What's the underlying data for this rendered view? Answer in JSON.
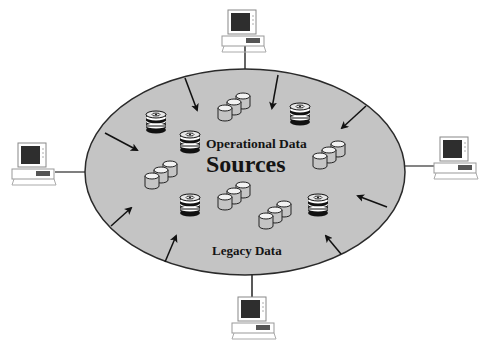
{
  "diagram": {
    "title_line1": "Operational Data",
    "title_line2": "Sources",
    "bottom_label": "Legacy Data",
    "colors": {
      "ellipse_fill": "#c4c4c4",
      "ellipse_stroke": "#2a2a2a",
      "arrow": "#111111",
      "monitor_screen": "#2e2e2e",
      "computer_body": "#ffffff",
      "connector": "#333333"
    },
    "computers": [
      {
        "id": "top",
        "icon": "desktop-computer-icon"
      },
      {
        "id": "left",
        "icon": "desktop-computer-icon"
      },
      {
        "id": "right",
        "icon": "desktop-computer-icon"
      },
      {
        "id": "bottom",
        "icon": "desktop-computer-icon"
      }
    ],
    "inner_icons": {
      "disk_stacks": 6,
      "cylinder_groups": 5
    },
    "arrows_count": 9
  }
}
